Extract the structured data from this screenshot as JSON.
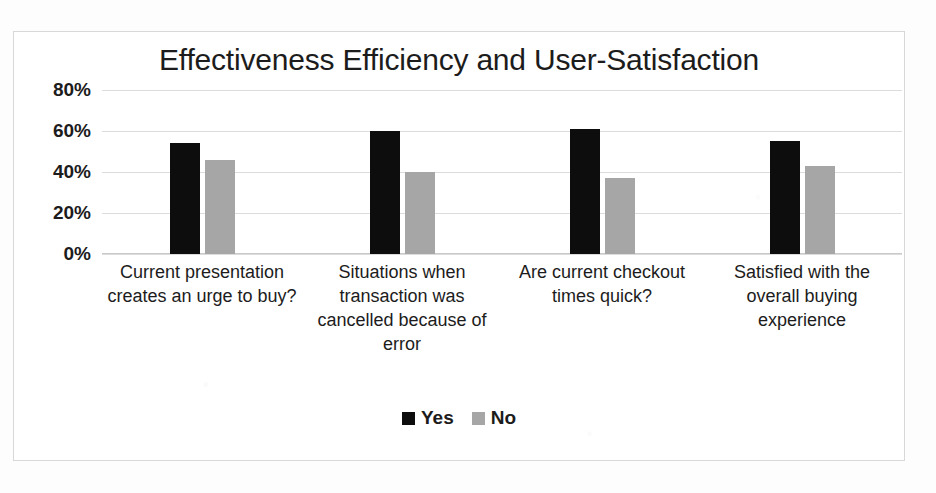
{
  "chart_data": {
    "type": "bar",
    "title": "Effectiveness Efficiency and User-Satisfaction",
    "xlabel": "",
    "ylabel": "",
    "ylim": [
      0,
      80
    ],
    "ytick_labels": [
      "0%",
      "20%",
      "40%",
      "60%",
      "80%"
    ],
    "ytick_values": [
      0,
      20,
      40,
      60,
      80
    ],
    "grid": true,
    "legend_position": "bottom",
    "categories": [
      "Current presentation creates an urge to buy?",
      "Situations when transaction was cancelled because of error",
      "Are current checkout times quick?",
      "Satisfied with the overall buying experience"
    ],
    "series": [
      {
        "name": "Yes",
        "color": "#0d0d0d",
        "values": [
          54,
          60,
          61,
          55
        ]
      },
      {
        "name": "No",
        "color": "#a6a6a6",
        "values": [
          46,
          40,
          37,
          43
        ]
      }
    ]
  }
}
